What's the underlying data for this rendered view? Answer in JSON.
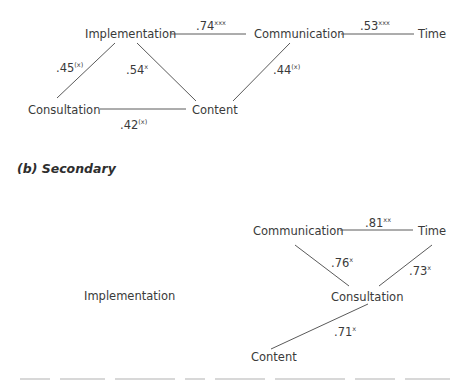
{
  "figure": {
    "section_b_heading": "(b) Secondary",
    "diagrams": [
      {
        "id": "a",
        "nodes": [
          {
            "id": "implementation",
            "label": "Implementation",
            "x": 85,
            "y": 38
          },
          {
            "id": "communication",
            "label": "Communication",
            "x": 254,
            "y": 38
          },
          {
            "id": "time",
            "label": "Time",
            "x": 418,
            "y": 38
          },
          {
            "id": "consultation",
            "label": "Consultation",
            "x": 28,
            "y": 114
          },
          {
            "id": "content",
            "label": "Content",
            "x": 192,
            "y": 114
          }
        ],
        "edges": [
          {
            "from": "implementation",
            "to": "communication",
            "coef": ".74",
            "sig": "xxx",
            "x1": 171,
            "y1": 34,
            "x2": 246,
            "y2": 34,
            "lx": 196,
            "ly": 30
          },
          {
            "from": "communication",
            "to": "time",
            "coef": ".53",
            "sig": "xxx",
            "x1": 341,
            "y1": 34,
            "x2": 414,
            "y2": 34,
            "lx": 360,
            "ly": 30
          },
          {
            "from": "implementation",
            "to": "consultation",
            "coef": ".45",
            "sig": "(x)",
            "x1": 115,
            "y1": 43,
            "x2": 57,
            "y2": 98,
            "lx": 56,
            "ly": 72
          },
          {
            "from": "implementation",
            "to": "content",
            "coef": ".54",
            "sig": "x",
            "x1": 137,
            "y1": 43,
            "x2": 196,
            "y2": 101,
            "lx": 126,
            "ly": 74
          },
          {
            "from": "communication",
            "to": "content",
            "coef": ".44",
            "sig": "(x)",
            "x1": 290,
            "y1": 43,
            "x2": 233,
            "y2": 101,
            "lx": 273,
            "ly": 74
          },
          {
            "from": "consultation",
            "to": "content",
            "coef": ".42",
            "sig": "(x)",
            "x1": 100,
            "y1": 109,
            "x2": 186,
            "y2": 109,
            "lx": 120,
            "ly": 129
          }
        ]
      },
      {
        "id": "b",
        "nodes": [
          {
            "id": "communication",
            "label": "Communication",
            "x": 253,
            "y": 235
          },
          {
            "id": "time",
            "label": "Time",
            "x": 418,
            "y": 235
          },
          {
            "id": "implementation",
            "label": "Implementation",
            "x": 84,
            "y": 300
          },
          {
            "id": "consultation",
            "label": "Consultation",
            "x": 331,
            "y": 301
          },
          {
            "id": "content",
            "label": "Content",
            "x": 251,
            "y": 361
          }
        ],
        "edges": [
          {
            "from": "communication",
            "to": "time",
            "coef": ".81",
            "sig": "xx",
            "x1": 340,
            "y1": 230,
            "x2": 413,
            "y2": 230,
            "lx": 365,
            "ly": 227
          },
          {
            "from": "communication",
            "to": "consultation",
            "coef": ".76",
            "sig": "x",
            "x1": 295,
            "y1": 245,
            "x2": 349,
            "y2": 286,
            "lx": 331,
            "ly": 267
          },
          {
            "from": "time",
            "to": "consultation",
            "coef": ".73",
            "sig": "x",
            "x1": 432,
            "y1": 245,
            "x2": 379,
            "y2": 286,
            "lx": 409,
            "ly": 275
          },
          {
            "from": "consultation",
            "to": "content",
            "coef": ".71",
            "sig": "x",
            "x1": 368,
            "y1": 304,
            "x2": 271,
            "y2": 349,
            "lx": 334,
            "ly": 336
          }
        ]
      }
    ]
  }
}
